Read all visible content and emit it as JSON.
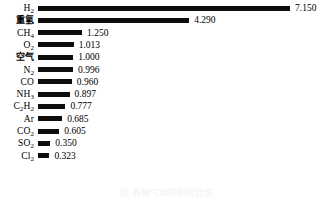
{
  "chart_data": {
    "type": "bar",
    "orientation": "horizontal",
    "title": "",
    "xlabel": "",
    "ylabel": "",
    "grid": false,
    "legend": null,
    "xlim": [
      0,
      7.15
    ],
    "bar_color": "#0d0d0d",
    "background_color": "#ffffff",
    "value_label_format": "3 decimal places",
    "categories": [
      "H2",
      "重氢",
      "CH4",
      "O2",
      "空气",
      "N2",
      "CO",
      "NH3",
      "C2H2",
      "Ar",
      "CO2",
      "SO2",
      "Cl2"
    ],
    "values": [
      7.15,
      4.29,
      1.25,
      1.013,
      1.0,
      0.996,
      0.96,
      0.897,
      0.777,
      0.685,
      0.605,
      0.35,
      0.323
    ],
    "value_labels": [
      "7.150",
      "4.290",
      "1.250",
      "1.013",
      "1.000",
      "0.996",
      "0.960",
      "0.897",
      "0.777",
      "0.685",
      "0.605",
      "0.350",
      "0.323"
    ],
    "category_label_html": [
      "H<sub>2</sub>",
      "<span class=\"cjk\">重氢</span>",
      "CH<sub>4</sub>",
      "O<sub>2</sub>",
      "<span class=\"cjk\">空气</span>",
      "N<sub>2</sub>",
      "CO",
      "NH<sub>3</sub>",
      "C<sub>2</sub>H<sub>2</sub>",
      "Ar",
      "CO<sub>2</sub>",
      "SO<sub>2</sub>",
      "Cl<sub>2</sub>"
    ]
  },
  "caption": {
    "text": "图   各种气体的相对数值",
    "note": "clipped at bottom edge, illegible"
  }
}
